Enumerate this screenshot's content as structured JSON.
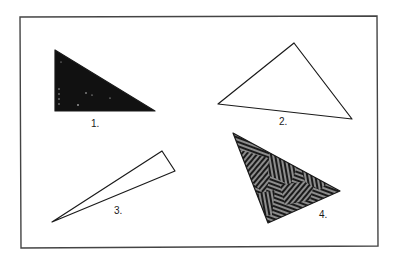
{
  "figure": {
    "background": "#ffffff",
    "ink": "#1a1a1a",
    "frame": {
      "points": "20,17 377,16 378,246 21,248"
    },
    "triangles": [
      {
        "id": 1,
        "label": "1.",
        "fill": "solid-black",
        "points": "55,50 55,111 155,111",
        "label_pos": [
          91,
          127
        ]
      },
      {
        "id": 2,
        "label": "2.",
        "fill": "none",
        "points": "218,104 294,43 352,119",
        "label_pos": [
          279,
          125
        ]
      },
      {
        "id": 3,
        "label": "3.",
        "fill": "none",
        "points": "52,222 162,151 175,171",
        "label_pos": [
          114,
          214
        ]
      },
      {
        "id": 4,
        "label": "4.",
        "fill": "hatched",
        "points": "233,133 340,191 268,223",
        "label_pos": [
          319,
          218
        ]
      }
    ]
  }
}
